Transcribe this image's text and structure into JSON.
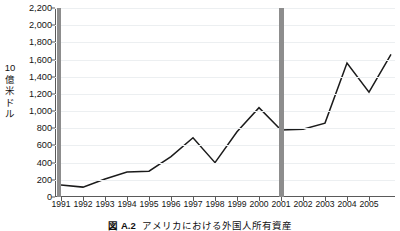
{
  "chart_data": {
    "type": "line",
    "title": "",
    "xlabel": "",
    "ylabel": "10億米ドル",
    "ylim": [
      0,
      2200
    ],
    "ytick_step": 200,
    "grid": true,
    "legend": "none",
    "categories": [
      "1991",
      "1992",
      "1993",
      "1994",
      "1995",
      "1996",
      "1997",
      "1998",
      "1999",
      "2000",
      "2001",
      "2002",
      "2003",
      "2004",
      "2005",
      "2006"
    ],
    "values": [
      140,
      115,
      210,
      290,
      300,
      470,
      690,
      400,
      760,
      1040,
      780,
      790,
      860,
      1560,
      1220,
      1660
    ],
    "x_tick_labels": [
      "1991",
      "1992",
      "1993",
      "1994",
      "1995",
      "1996",
      "1997",
      "1998",
      "1999",
      "2000",
      "2001",
      "2002",
      "2003",
      "2004",
      "2005"
    ],
    "y_tick_labels": [
      "0",
      "200",
      "400",
      "600",
      "800",
      "1,000",
      "1,200",
      "1,400",
      "1,600",
      "1,800",
      "2,000",
      "2,200"
    ],
    "annotations": [
      {
        "name": "recession-band-1991",
        "type": "vertical-band",
        "from": 1990.8,
        "to": 1991.0
      },
      {
        "name": "recession-band-2001",
        "type": "vertical-band",
        "from": 2000.9,
        "to": 2001.15
      }
    ],
    "series_color": "#1b1b1b",
    "band_color": "#8d8d8d",
    "grid_color": "#eceff1",
    "axis_color": "#5a5a5a"
  },
  "caption": {
    "number": "図 A.2",
    "text": "アメリカにおける外国人所有資産"
  }
}
